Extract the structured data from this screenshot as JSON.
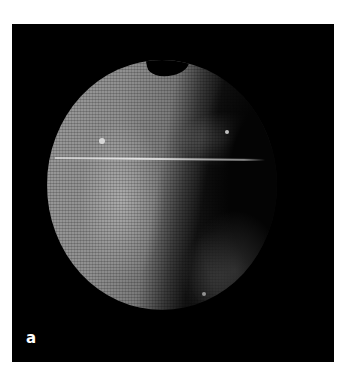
{
  "figure": {
    "panel_label": "a",
    "colors": {
      "background": "#000000",
      "page": "#ffffff",
      "label": "#ffffff"
    }
  }
}
